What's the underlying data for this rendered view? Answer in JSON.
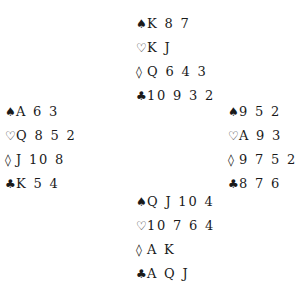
{
  "suits": {
    "spades": "♠",
    "hearts": "♡",
    "diamonds": "◊",
    "clubs": "♣"
  },
  "hands": {
    "north": {
      "spades": "K 8 7",
      "hearts": "K J",
      "diamonds": "Q 6 4 3",
      "clubs": "10 9 3 2"
    },
    "west": {
      "spades": "A 6 3",
      "hearts": "Q 8 5 2",
      "diamonds": "J 10 8",
      "clubs": "K 5 4"
    },
    "east": {
      "spades": "9 5 2",
      "hearts": "A 9 3",
      "diamonds": "9 7 5 2",
      "clubs": "8 7 6"
    },
    "south": {
      "spades": "Q J 10 4",
      "hearts": "10 7 6 4",
      "diamonds": "A K",
      "clubs": "A Q J"
    }
  }
}
